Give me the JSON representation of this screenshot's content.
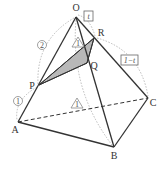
{
  "diagram": {
    "type": "tetrahedron-pyramid",
    "vertices": {
      "O": {
        "label": "O",
        "x": 76,
        "y": 17,
        "lx": 76,
        "ly": 11
      },
      "A": {
        "label": "A",
        "x": 18,
        "y": 122,
        "lx": 15,
        "ly": 133
      },
      "B": {
        "label": "B",
        "x": 114,
        "y": 147,
        "lx": 114,
        "ly": 159
      },
      "C": {
        "label": "C",
        "x": 148,
        "y": 98,
        "lx": 153,
        "ly": 106
      },
      "P": {
        "label": "P",
        "x": 39,
        "y": 85,
        "lx": 32,
        "ly": 89
      },
      "Q": {
        "label": "Q",
        "x": 87,
        "y": 63,
        "lx": 94,
        "ly": 69
      },
      "R": {
        "label": "R",
        "x": 94,
        "y": 38,
        "lx": 101,
        "ly": 36
      }
    },
    "ratio_labels": {
      "OR": "t",
      "RC": "1−t",
      "OP": "2",
      "PA": "1"
    },
    "equal_markers": {
      "symbol": "1",
      "count": 2
    },
    "colors": {
      "edge": "#333333",
      "arc": "#aaaaaa",
      "shade": "#b8b8b8",
      "box": "#666666"
    }
  }
}
